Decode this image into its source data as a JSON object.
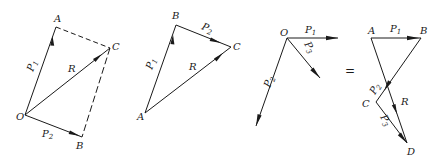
{
  "figure": {
    "stroke_color": "#1a1a1a",
    "background": "#ffffff"
  },
  "diagram_parallelogram": {
    "points": {
      "O": "O",
      "A": "A",
      "B": "B",
      "C": "C"
    },
    "vectors": {
      "P1": "P",
      "P1_sub": "1",
      "P2": "P",
      "P2_sub": "2",
      "R": "R"
    }
  },
  "diagram_triangle": {
    "points": {
      "A": "A",
      "B": "B",
      "C": "C"
    },
    "vectors": {
      "P1": "P",
      "P1_sub": "1",
      "P2": "P",
      "P2_sub": "2",
      "R": "R"
    }
  },
  "diagram_concurrent": {
    "points": {
      "O": "O"
    },
    "vectors": {
      "P1": "P",
      "P1_sub": "1",
      "P2": "P",
      "P2_sub": "2",
      "P3": "P",
      "P3_sub": "3"
    }
  },
  "equals_sign": "=",
  "diagram_polygon": {
    "points": {
      "A": "A",
      "B": "B",
      "C": "C",
      "D": "D"
    },
    "vectors": {
      "P1": "P",
      "P1_sub": "1",
      "P2": "P",
      "P2_sub": "2",
      "P3": "P",
      "P3_sub": "3",
      "R": "R"
    }
  }
}
